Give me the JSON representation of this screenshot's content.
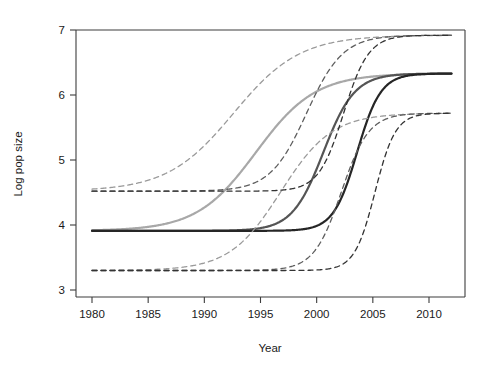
{
  "chart_data": {
    "type": "line",
    "title": "",
    "xlabel": "Year",
    "ylabel": "Log pop size",
    "xlim": [
      1980,
      2012
    ],
    "ylim": [
      2.83,
      7.12
    ],
    "xticks": [
      1980,
      1985,
      1990,
      1995,
      2000,
      2005,
      2010
    ],
    "yticks": [
      3,
      4,
      5,
      6,
      7
    ],
    "xtick_labels": [
      "1980",
      "1985",
      "1990",
      "1995",
      "2000",
      "2005",
      "2010"
    ],
    "ytick_labels": [
      "3",
      "4",
      "5",
      "6",
      "7"
    ],
    "grid": false,
    "legend": "none",
    "series": [
      {
        "name": "logistic-fit-1",
        "style": "solid",
        "color": "#a8a8a8",
        "width": 2.2,
        "lower_asymptote": 3.91,
        "upper_asymptote": 6.33,
        "midpoint_year": 1994.6,
        "rate": 0.38
      },
      {
        "name": "logistic-fit-2",
        "style": "solid",
        "color": "#555555",
        "width": 2.2,
        "lower_asymptote": 3.91,
        "upper_asymptote": 6.33,
        "midpoint_year": 2000.6,
        "rate": 0.72
      },
      {
        "name": "logistic-fit-3",
        "style": "solid",
        "color": "#262626",
        "width": 2.2,
        "lower_asymptote": 3.91,
        "upper_asymptote": 6.33,
        "midpoint_year": 2003.6,
        "rate": 0.95
      },
      {
        "name": "band-1-upper",
        "style": "dashed",
        "color": "#9a9a9a",
        "width": 1.3,
        "lower_asymptote": 4.52,
        "upper_asymptote": 6.92,
        "midpoint_year": 1992.6,
        "rate": 0.34
      },
      {
        "name": "band-1-lower",
        "style": "dashed",
        "color": "#9a9a9a",
        "width": 1.3,
        "lower_asymptote": 3.3,
        "upper_asymptote": 5.72,
        "midpoint_year": 1996.8,
        "rate": 0.44
      },
      {
        "name": "band-2-upper",
        "style": "dashed",
        "color": "#5e5e5e",
        "width": 1.3,
        "lower_asymptote": 4.52,
        "upper_asymptote": 6.92,
        "midpoint_year": 1999.1,
        "rate": 0.62
      },
      {
        "name": "band-2-lower",
        "style": "dashed",
        "color": "#5e5e5e",
        "width": 1.3,
        "lower_asymptote": 3.3,
        "upper_asymptote": 5.72,
        "midpoint_year": 2002.2,
        "rate": 0.82
      },
      {
        "name": "band-3-upper",
        "style": "dashed",
        "color": "#333333",
        "width": 1.3,
        "lower_asymptote": 4.52,
        "upper_asymptote": 6.92,
        "midpoint_year": 2002.4,
        "rate": 0.9
      },
      {
        "name": "band-3-lower",
        "style": "dashed",
        "color": "#333333",
        "width": 1.3,
        "lower_asymptote": 3.3,
        "upper_asymptote": 5.72,
        "midpoint_year": 2005.2,
        "rate": 1.1
      }
    ]
  },
  "axes": {
    "x_title": "Year",
    "y_title": "Log pop size"
  }
}
